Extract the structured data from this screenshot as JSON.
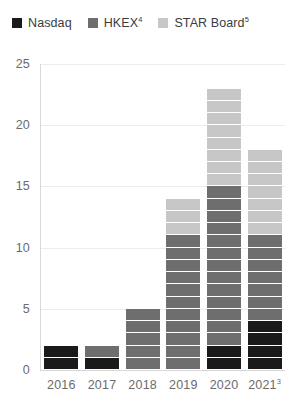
{
  "chart_data": {
    "type": "bar",
    "stacked": true,
    "title": "",
    "subtitle": "",
    "xlabel": "",
    "ylabel": "",
    "categories": [
      "2016",
      "2017",
      "2018",
      "2019",
      "2020",
      "2021"
    ],
    "category_labels": [
      {
        "text": "2016",
        "superscript": ""
      },
      {
        "text": "2017",
        "superscript": ""
      },
      {
        "text": "2018",
        "superscript": ""
      },
      {
        "text": "2019",
        "superscript": ""
      },
      {
        "text": "2020",
        "superscript": ""
      },
      {
        "text": "2021",
        "superscript": "3"
      }
    ],
    "series": [
      {
        "name": "Nasdaq",
        "superscript": "",
        "color": "#1a1a1a",
        "values": [
          2,
          1,
          0,
          0,
          2,
          4
        ]
      },
      {
        "name": "HKEX",
        "superscript": "4",
        "color": "#6e6e6e",
        "values": [
          0,
          1,
          5,
          11,
          13,
          7
        ]
      },
      {
        "name": "STAR Board",
        "superscript": "5",
        "color": "#c7c7c7",
        "values": [
          0,
          0,
          0,
          3,
          8,
          7
        ]
      }
    ],
    "totals": [
      2,
      2,
      5,
      14,
      23,
      18
    ],
    "ylim": [
      0,
      25
    ],
    "yticks": [
      0,
      5,
      10,
      15,
      20,
      25
    ],
    "ytick_labels": [
      "0",
      "5",
      "10",
      "15",
      "20",
      "25"
    ],
    "grid": true,
    "grid_axis": "y",
    "legend_position": "top-left",
    "unit_segment_size": 1
  },
  "legend": {
    "items": [
      {
        "label": "Nasdaq",
        "superscript": "",
        "color": "#1a1a1a"
      },
      {
        "label": "HKEX",
        "superscript": "4",
        "color": "#6e6e6e"
      },
      {
        "label": "STAR Board",
        "superscript": "5",
        "color": "#c7c7c7"
      }
    ]
  },
  "colors": {
    "nasdaq": "#1a1a1a",
    "hkex": "#6e6e6e",
    "star_board": "#c7c7c7",
    "gridline": "#ececec",
    "axis": "#d8d8d8",
    "tick_text": "#6b6b6b",
    "legend_text": "#3b3b3b",
    "background": "#ffffff"
  }
}
